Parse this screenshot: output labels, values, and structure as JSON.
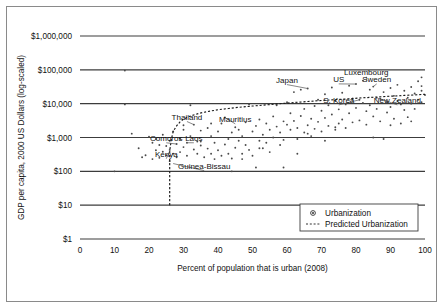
{
  "chart_data": {
    "type": "scatter",
    "title": "",
    "xlabel": "Percent of population that is urban (2008)",
    "ylabel": "GDP per capita, 2000 US Dollars (log-scaled)",
    "xlim": [
      0,
      100
    ],
    "ylim_log": [
      1,
      1000000
    ],
    "grid": true,
    "legend_position": "bottom-right",
    "xticks": [
      "0",
      "10",
      "20",
      "30",
      "40",
      "50",
      "60",
      "70",
      "80",
      "90",
      "100"
    ],
    "xtick_values": [
      0,
      10,
      20,
      30,
      40,
      50,
      60,
      70,
      80,
      90,
      100
    ],
    "yticks": [
      "$1",
      "$10",
      "$100",
      "$1,000",
      "$10,000",
      "$100,000",
      "$1,000,000"
    ],
    "ytick_values": [
      1,
      10,
      100,
      1000,
      10000,
      100000,
      1000000
    ],
    "legend": [
      {
        "label": "Urbanization",
        "marker": "circle-dot"
      },
      {
        "label": "Predicted Urbanization",
        "marker": "dotted-line"
      }
    ],
    "annotations": [
      {
        "label": "Luxembourg",
        "x": 83,
        "y": 72000,
        "anchor": "middle",
        "leader_to": [
          83,
          48000
        ]
      },
      {
        "label": "US",
        "x": 75,
        "y": 44000,
        "anchor": "middle",
        "leader_to": [
          80,
          38000
        ]
      },
      {
        "label": "Sweden",
        "x": 86,
        "y": 44000,
        "anchor": "middle",
        "leader_to": [
          85,
          32000
        ]
      },
      {
        "label": "Japan",
        "x": 60,
        "y": 42000,
        "anchor": "middle",
        "leader_to": [
          66,
          28000
        ]
      },
      {
        "label": "S. Korea",
        "x": 75,
        "y": 10500,
        "anchor": "middle",
        "leader_to": [
          81,
          13000
        ]
      },
      {
        "label": "New Zealand",
        "x": 92,
        "y": 10500,
        "anchor": "middle",
        "leader_to": [
          87,
          14000
        ]
      },
      {
        "label": "Mauritius",
        "x": 45,
        "y": 2900,
        "anchor": "middle",
        "leader_to": [
          42,
          3900
        ]
      },
      {
        "label": "Thailand",
        "x": 31,
        "y": 3400,
        "anchor": "middle",
        "leader_to": [
          33,
          2400
        ]
      },
      {
        "label": "Comoros",
        "x": 25,
        "y": 800,
        "anchor": "middle",
        "leader_to": [
          28,
          640
        ]
      },
      {
        "label": "Laos",
        "x": 33,
        "y": 800,
        "anchor": "middle",
        "leader_to": [
          31,
          700
        ]
      },
      {
        "label": "Kenya",
        "x": 25,
        "y": 270,
        "anchor": "middle",
        "leader_to": [
          26,
          400
        ]
      },
      {
        "label": "Guinea-Bissau",
        "x": 36,
        "y": 120,
        "anchor": "middle",
        "leader_to": [
          27,
          170
        ]
      }
    ],
    "series": [
      {
        "name": "Urbanization",
        "points": [
          [
            10,
            100
          ],
          [
            13,
            95000
          ],
          [
            13,
            9500
          ],
          [
            15,
            1300
          ],
          [
            17,
            480
          ],
          [
            18,
            260
          ],
          [
            19,
            300
          ],
          [
            20,
            1050
          ],
          [
            21,
            700
          ],
          [
            21,
            230
          ],
          [
            22,
            420
          ],
          [
            22,
            900
          ],
          [
            23,
            250
          ],
          [
            23,
            600
          ],
          [
            24,
            380
          ],
          [
            24,
            1200
          ],
          [
            25,
            300
          ],
          [
            25,
            560
          ],
          [
            26,
            200
          ],
          [
            26,
            430
          ],
          [
            26,
            800
          ],
          [
            27,
            330
          ],
          [
            27,
            1500
          ],
          [
            28,
            640
          ],
          [
            28,
            260
          ],
          [
            29,
            900
          ],
          [
            29,
            370
          ],
          [
            30,
            2300
          ],
          [
            30,
            520
          ],
          [
            31,
            700
          ],
          [
            31,
            290
          ],
          [
            32,
            1100
          ],
          [
            32,
            9000
          ],
          [
            33,
            2400
          ],
          [
            33,
            440
          ],
          [
            34,
            760
          ],
          [
            34,
            330
          ],
          [
            35,
            1600
          ],
          [
            35,
            580
          ],
          [
            36,
            260
          ],
          [
            37,
            1900
          ],
          [
            37,
            470
          ],
          [
            38,
            330
          ],
          [
            38,
            1100
          ],
          [
            39,
            700
          ],
          [
            39,
            230
          ],
          [
            40,
            1500
          ],
          [
            40,
            420
          ],
          [
            41,
            2600
          ],
          [
            41,
            290
          ],
          [
            42,
            3900
          ],
          [
            42,
            620
          ],
          [
            43,
            900
          ],
          [
            43,
            330
          ],
          [
            44,
            1400
          ],
          [
            44,
            240
          ],
          [
            45,
            2000
          ],
          [
            45,
            500
          ],
          [
            46,
            800
          ],
          [
            46,
            1700
          ],
          [
            47,
            330
          ],
          [
            47,
            1100
          ],
          [
            48,
            2800
          ],
          [
            48,
            600
          ],
          [
            49,
            9500
          ],
          [
            49,
            430
          ],
          [
            50,
            1500
          ],
          [
            50,
            290
          ],
          [
            51,
            2200
          ],
          [
            51,
            130
          ],
          [
            52,
            800
          ],
          [
            52,
            3400
          ],
          [
            53,
            1200
          ],
          [
            53,
            480
          ],
          [
            54,
            2600
          ],
          [
            54,
            700
          ],
          [
            55,
            1700
          ],
          [
            55,
            370
          ],
          [
            56,
            4200
          ],
          [
            56,
            1000
          ],
          [
            57,
            9000
          ],
          [
            57,
            2100
          ],
          [
            58,
            600
          ],
          [
            58,
            1400
          ],
          [
            59,
            3000
          ],
          [
            59,
            850
          ],
          [
            60,
            11000
          ],
          [
            60,
            2400
          ],
          [
            61,
            1700
          ],
          [
            61,
            5200
          ],
          [
            62,
            22000
          ],
          [
            62,
            3100
          ],
          [
            63,
            900
          ],
          [
            63,
            1900
          ],
          [
            64,
            26000
          ],
          [
            64,
            4300
          ],
          [
            65,
            1400
          ],
          [
            65,
            7000
          ],
          [
            66,
            28000
          ],
          [
            66,
            2300
          ],
          [
            67,
            3600
          ],
          [
            67,
            1100
          ],
          [
            68,
            8500
          ],
          [
            68,
            1800
          ],
          [
            69,
            13000
          ],
          [
            69,
            2900
          ],
          [
            70,
            6200
          ],
          [
            70,
            1500
          ],
          [
            71,
            19000
          ],
          [
            71,
            3800
          ],
          [
            72,
            2200
          ],
          [
            72,
            9000
          ],
          [
            73,
            30000
          ],
          [
            73,
            4800
          ],
          [
            74,
            1700
          ],
          [
            74,
            12000
          ],
          [
            75,
            6800
          ],
          [
            75,
            2600
          ],
          [
            76,
            21000
          ],
          [
            76,
            3400
          ],
          [
            77,
            9500
          ],
          [
            77,
            1900
          ],
          [
            78,
            34000
          ],
          [
            78,
            5200
          ],
          [
            79,
            14000
          ],
          [
            79,
            2800
          ],
          [
            80,
            38000
          ],
          [
            80,
            7500
          ],
          [
            81,
            13000
          ],
          [
            81,
            3200
          ],
          [
            82,
            48000
          ],
          [
            82,
            10500
          ],
          [
            83,
            6000
          ],
          [
            83,
            2400
          ],
          [
            84,
            26000
          ],
          [
            84,
            9000
          ],
          [
            85,
            32000
          ],
          [
            85,
            4200
          ],
          [
            86,
            15000
          ],
          [
            86,
            7000
          ],
          [
            87,
            14000
          ],
          [
            87,
            3000
          ],
          [
            88,
            22000
          ],
          [
            88,
            900
          ],
          [
            89,
            11000
          ],
          [
            89,
            5500
          ],
          [
            90,
            29000
          ],
          [
            90,
            8000
          ],
          [
            91,
            17000
          ],
          [
            91,
            3600
          ],
          [
            92,
            36000
          ],
          [
            92,
            12000
          ],
          [
            93,
            9500
          ],
          [
            93,
            2600
          ],
          [
            94,
            24000
          ],
          [
            94,
            6500
          ],
          [
            95,
            15000
          ],
          [
            95,
            4000
          ],
          [
            96,
            31000
          ],
          [
            96,
            10000
          ],
          [
            97,
            20000
          ],
          [
            97,
            7000
          ],
          [
            98,
            46000
          ],
          [
            98,
            13000
          ],
          [
            99,
            60000
          ],
          [
            99,
            24000
          ],
          [
            99,
            11000
          ],
          [
            100,
            18000
          ],
          [
            44,
            100
          ],
          [
            59,
            130
          ],
          [
            35,
            760
          ],
          [
            47,
            230
          ],
          [
            52,
            480
          ],
          [
            63,
            330
          ],
          [
            71,
            800
          ],
          [
            85,
            1000
          ],
          [
            30,
            1700
          ],
          [
            38,
            2600
          ],
          [
            66,
            1300
          ],
          [
            74,
            2000
          ],
          [
            90,
            2300
          ],
          [
            96,
            3000
          ],
          [
            99,
            33000
          ]
        ]
      }
    ],
    "predicted_curve": {
      "name": "Predicted Urbanization",
      "points": [
        [
          26,
          10
        ],
        [
          26,
          120
        ],
        [
          26,
          400
        ],
        [
          26.5,
          900
        ],
        [
          27,
          1500
        ],
        [
          28,
          2200
        ],
        [
          29,
          2900
        ],
        [
          30,
          3500
        ],
        [
          32,
          4300
        ],
        [
          34,
          5000
        ],
        [
          36,
          5600
        ],
        [
          38,
          6100
        ],
        [
          40,
          6600
        ],
        [
          43,
          7200
        ],
        [
          46,
          7800
        ],
        [
          50,
          8500
        ],
        [
          54,
          9200
        ],
        [
          58,
          10000
        ],
        [
          62,
          10800
        ],
        [
          66,
          11600
        ],
        [
          70,
          12400
        ],
        [
          74,
          13200
        ],
        [
          78,
          14000
        ],
        [
          82,
          14900
        ],
        [
          86,
          15700
        ],
        [
          90,
          16600
        ],
        [
          94,
          17500
        ],
        [
          98,
          18400
        ],
        [
          100,
          18900
        ]
      ]
    }
  }
}
